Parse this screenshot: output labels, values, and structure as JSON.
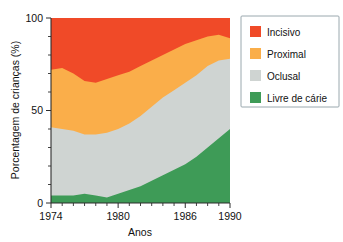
{
  "chart_data": {
    "type": "area",
    "stacked": true,
    "title": "",
    "subtitle": "",
    "xlabel": "Anos",
    "ylabel": "Porcentagem de crianças (%)",
    "xlim": [
      1974,
      1990
    ],
    "ylim": [
      0,
      100
    ],
    "grid": false,
    "legend_position": "right",
    "x": [
      1974,
      1975,
      1976,
      1977,
      1978,
      1979,
      1980,
      1981,
      1982,
      1983,
      1984,
      1985,
      1986,
      1987,
      1988,
      1989,
      1990
    ],
    "xticks": [
      1974,
      1980,
      1986,
      1990
    ],
    "xtick_labels": [
      "1974",
      "1980",
      "1986",
      "1990"
    ],
    "xtick_minor_step": 1,
    "yticks": [
      0,
      50,
      100
    ],
    "ytick_labels": [
      "0",
      "50",
      "100"
    ],
    "ytick_minor_step": 10,
    "series": [
      {
        "name": "Livre de cárie",
        "color": "#3E9B57",
        "values": [
          4,
          4,
          4,
          5,
          4,
          3,
          5,
          7,
          9,
          12,
          15,
          18,
          21,
          25,
          30,
          35,
          40
        ]
      },
      {
        "name": "Oclusal",
        "color": "#CFD4D2",
        "values": [
          37,
          36,
          35,
          32,
          33,
          35,
          35,
          36,
          38,
          40,
          42,
          43,
          44,
          44,
          44,
          42,
          38
        ]
      },
      {
        "name": "Proximal",
        "color": "#FAAE4A",
        "values": [
          31,
          33,
          31,
          29,
          28,
          29,
          29,
          28,
          27,
          25,
          23,
          22,
          21,
          19,
          16,
          14,
          11
        ]
      },
      {
        "name": "Incisivo",
        "color": "#F04A28",
        "values": [
          28,
          27,
          30,
          34,
          35,
          33,
          31,
          29,
          26,
          23,
          20,
          17,
          14,
          12,
          10,
          9,
          11
        ]
      }
    ],
    "cumulative_tops": {
      "livre_de_carie": [
        4,
        4,
        4,
        5,
        4,
        3,
        5,
        7,
        9,
        12,
        15,
        18,
        21,
        25,
        30,
        35,
        40
      ],
      "oclusal": [
        41,
        40,
        39,
        37,
        37,
        38,
        40,
        43,
        47,
        52,
        57,
        61,
        65,
        69,
        74,
        77,
        78
      ],
      "proximal": [
        72,
        73,
        70,
        66,
        65,
        67,
        69,
        71,
        74,
        77,
        80,
        83,
        86,
        88,
        90,
        91,
        89
      ],
      "incisivo": [
        100,
        100,
        100,
        100,
        100,
        100,
        100,
        100,
        100,
        100,
        100,
        100,
        100,
        100,
        100,
        100,
        100
      ]
    }
  },
  "legend": {
    "items": [
      {
        "label": "Incisivo",
        "color": "#F04A28"
      },
      {
        "label": "Proximal",
        "color": "#FAAE4A"
      },
      {
        "label": "Oclusal",
        "color": "#CFD4D2"
      },
      {
        "label": "Livre de cárie",
        "color": "#3E9B57"
      }
    ]
  },
  "axes": {
    "y_title": "Porcentagem de crianças (%)",
    "x_title": "Anos",
    "y_labels": [
      "100",
      "50",
      "0"
    ],
    "x_labels": [
      "1974",
      "1980",
      "1986",
      "1990"
    ]
  }
}
